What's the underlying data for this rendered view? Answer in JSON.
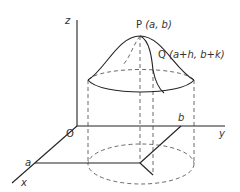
{
  "diagram": {
    "axes": {
      "z_label": "z",
      "y_label": "y",
      "x_label": "x",
      "origin_label": "O"
    },
    "points": {
      "P_label": "P",
      "P_coords": "(a, b)",
      "Q_label": "Q",
      "Q_coords": "(a+h, b+k)"
    },
    "plane_marks": {
      "a_label": "a",
      "b_label": "b"
    },
    "colors": {
      "line": "#222222",
      "dashed": "#444444",
      "background": "#ffffff"
    }
  }
}
